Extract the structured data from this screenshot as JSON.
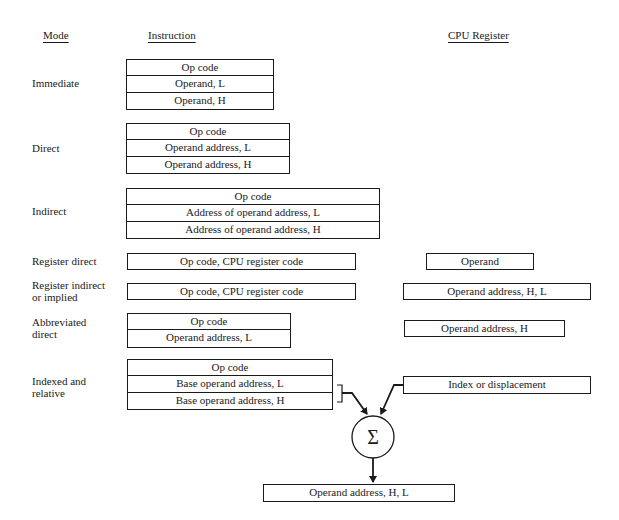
{
  "headers": {
    "mode": "Mode",
    "instruction": "Instruction",
    "cpu_register": "CPU Register"
  },
  "modes": [
    {
      "label": "Immediate",
      "instruction": [
        "Op code",
        "Operand, L",
        "Operand, H"
      ],
      "register": null
    },
    {
      "label": "Direct",
      "instruction": [
        "Op code",
        "Operand address, L",
        "Operand address, H"
      ],
      "register": null
    },
    {
      "label": "Indirect",
      "instruction": [
        "Op code",
        "Address of operand address, L",
        "Address of operand address, H"
      ],
      "register": null
    },
    {
      "label": "Register direct",
      "instruction": [
        "Op code, CPU register code"
      ],
      "register": "Operand"
    },
    {
      "label": "Register indirect\nor implied",
      "instruction": [
        "Op code, CPU register code"
      ],
      "register": "Operand address, H, L"
    },
    {
      "label": "Abbreviated\ndirect",
      "instruction": [
        "Op code",
        "Operand address, L"
      ],
      "register": "Operand address, H"
    },
    {
      "label": "Indexed and\nrelative",
      "instruction": [
        "Op code",
        "Base operand address, L",
        "Base operand address, H"
      ],
      "register": "Index or displacement"
    }
  ],
  "adder": {
    "symbol": "Σ",
    "result": "Operand address, H, L"
  }
}
